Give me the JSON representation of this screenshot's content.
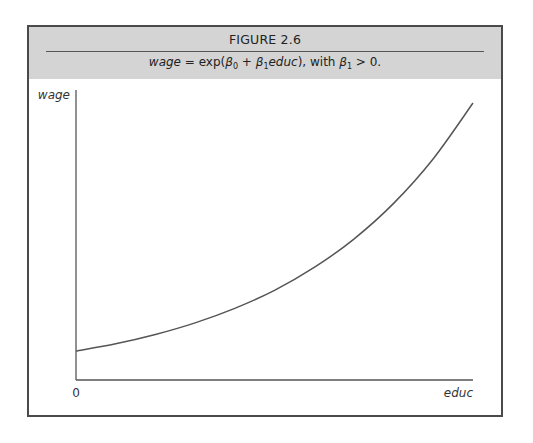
{
  "figure": {
    "title": "FIGURE 2.6",
    "subtitle_parts": {
      "lhs": "wage",
      "eq": " = exp(",
      "b0": "β",
      "b0_sub": "0",
      "plus": " + ",
      "b1": "β",
      "b1_sub": "1",
      "var": "educ",
      "close": "), with ",
      "b1b": "β",
      "b1b_sub": "1",
      "cond": " > 0."
    }
  },
  "chart_data": {
    "type": "line",
    "title": "FIGURE 2.6",
    "subtitle": "wage = exp(β0 + β1educ), with β1 > 0.",
    "xlabel": "educ",
    "ylabel": "wage",
    "x_tick_labels": [
      "0"
    ],
    "xlim": [
      0,
      1
    ],
    "ylim": [
      0,
      1
    ],
    "grid": false,
    "legend": "none",
    "series": [
      {
        "name": "wage = exp(β0 + β1educ)",
        "x": [
          0,
          0.1,
          0.2,
          0.3,
          0.4,
          0.5,
          0.6,
          0.7,
          0.8,
          0.9,
          1.0
        ],
        "y": [
          0.1,
          0.125,
          0.157,
          0.197,
          0.247,
          0.309,
          0.388,
          0.486,
          0.609,
          0.763,
          0.955
        ]
      }
    ]
  },
  "colors": {
    "header_bg": "#d4d4d4",
    "frame": "#4a4a4a",
    "axis": "#555555",
    "curve": "#555555"
  }
}
